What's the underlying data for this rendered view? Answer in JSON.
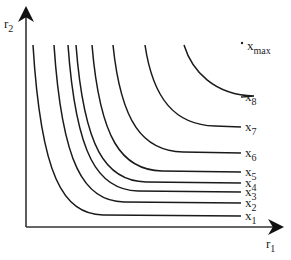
{
  "axes": {
    "x_label": "r",
    "x_sub": "1",
    "y_label": "r",
    "y_sub": "2"
  },
  "point_label": {
    "base": "x",
    "sub": "max"
  },
  "curves": [
    {
      "label": "x",
      "sub": "1",
      "top_x": 33,
      "end_y": 216
    },
    {
      "label": "x",
      "sub": "2",
      "top_x": 54,
      "end_y": 203
    },
    {
      "label": "x",
      "sub": "3",
      "top_x": 68,
      "end_y": 192
    },
    {
      "label": "x",
      "sub": "4",
      "top_x": 76,
      "end_y": 183
    },
    {
      "label": "x",
      "sub": "5",
      "top_x": 92,
      "end_y": 172
    },
    {
      "label": "x",
      "sub": "6",
      "top_x": 113,
      "end_y": 153
    },
    {
      "label": "x",
      "sub": "7",
      "top_x": 145,
      "end_y": 127
    },
    {
      "label": "x",
      "sub": "8",
      "top_x": 184,
      "end_y": 97
    }
  ],
  "colors": {
    "line": "#1a1a1a",
    "axis": "#333333"
  }
}
